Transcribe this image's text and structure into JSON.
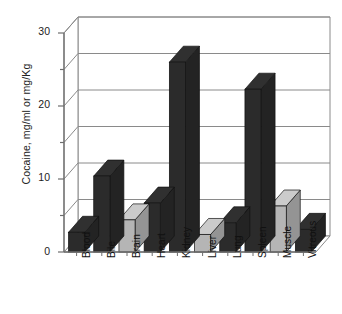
{
  "chart_data": {
    "type": "bar",
    "title": "",
    "subtitle": "",
    "xlabel": "",
    "ylabel": "Cocaine, mg/ml or mg/Kg",
    "categories": [
      "Blood",
      "Bile",
      "Brain",
      "Heart",
      "Kidney",
      "Liver",
      "Lung",
      "Spleen",
      "Muscle",
      "Vitreous"
    ],
    "values": [
      2.7,
      10.4,
      4.4,
      6.7,
      26.0,
      2.4,
      4.0,
      22.3,
      6.3,
      3.1
    ],
    "series": [
      {
        "name": "Cocaine concentration",
        "values": [
          2.7,
          10.4,
          4.4,
          6.7,
          26.0,
          2.4,
          4.0,
          22.3,
          6.3,
          3.1
        ]
      }
    ],
    "bar_colors": [
      "#2b2b2b",
      "#2b2b2b",
      "#b5b5b5",
      "#2b2b2b",
      "#2b2b2b",
      "#b5b5b5",
      "#2b2b2b",
      "#2b2b2b",
      "#b5b5b5",
      "#2b2b2b"
    ],
    "ylim": [
      0,
      30
    ],
    "yticks": [
      0,
      10,
      20,
      30
    ],
    "ytick_labels": [
      "0",
      "10",
      "20",
      "30"
    ],
    "gridlines": [
      5,
      10,
      15,
      20,
      25,
      30
    ],
    "grid": true,
    "legend": "none",
    "style": "3d-bar",
    "colors": {
      "bar_dark": "#2b2b2b",
      "bar_light": "#b5b5b5",
      "axis": "#6e6e6e",
      "grid": "#8a8a8a",
      "background": "#ffffff",
      "text": "#1a1a1a"
    }
  }
}
